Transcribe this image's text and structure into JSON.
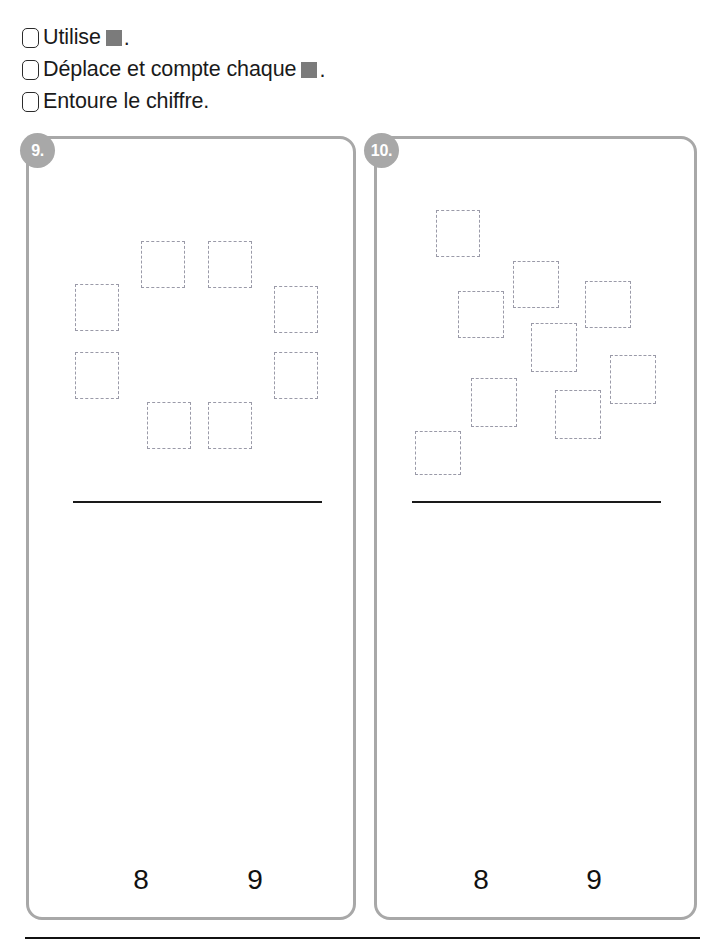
{
  "worksheet": {
    "instructions": [
      {
        "id": "utilise",
        "before": "Utilise",
        "chip": "gray-square",
        "after": "."
      },
      {
        "id": "deplace",
        "before": "Déplace et compte chaque",
        "chip": "gray-square",
        "after": "."
      },
      {
        "id": "entoure",
        "before": "Entoure le chiffre.",
        "chip": null,
        "after": ""
      }
    ],
    "colors": {
      "chip_gray": "#7b7b7b",
      "panel_border": "#a8a8a8",
      "badge_fill": "#a8a8a8",
      "dashed_square": "#9a9aa8",
      "rule_black": "#111111"
    },
    "exercises": [
      {
        "number": "9.",
        "count": 8,
        "arrangement": "ring",
        "choices": [
          "8",
          "9"
        ],
        "squares": [
          {
            "x": 138,
            "y": 238,
            "w": 44,
            "h": 47
          },
          {
            "x": 205,
            "y": 238,
            "w": 44,
            "h": 47
          },
          {
            "x": 72,
            "y": 281,
            "w": 44,
            "h": 47
          },
          {
            "x": 271,
            "y": 283,
            "w": 44,
            "h": 47
          },
          {
            "x": 72,
            "y": 349,
            "w": 44,
            "h": 47
          },
          {
            "x": 271,
            "y": 349,
            "w": 44,
            "h": 47
          },
          {
            "x": 144,
            "y": 399,
            "w": 44,
            "h": 47
          },
          {
            "x": 205,
            "y": 399,
            "w": 44,
            "h": 47
          }
        ]
      },
      {
        "number": "10.",
        "count": 9,
        "arrangement": "scattered",
        "choices": [
          "8",
          "9"
        ],
        "squares": [
          {
            "x": 433,
            "y": 207,
            "w": 44,
            "h": 47
          },
          {
            "x": 510,
            "y": 258,
            "w": 46,
            "h": 47
          },
          {
            "x": 455,
            "y": 288,
            "w": 46,
            "h": 47
          },
          {
            "x": 582,
            "y": 278,
            "w": 46,
            "h": 47
          },
          {
            "x": 528,
            "y": 320,
            "w": 46,
            "h": 49
          },
          {
            "x": 607,
            "y": 352,
            "w": 46,
            "h": 49
          },
          {
            "x": 468,
            "y": 375,
            "w": 46,
            "h": 49
          },
          {
            "x": 552,
            "y": 387,
            "w": 46,
            "h": 49
          },
          {
            "x": 412,
            "y": 428,
            "w": 46,
            "h": 44
          }
        ]
      }
    ]
  }
}
